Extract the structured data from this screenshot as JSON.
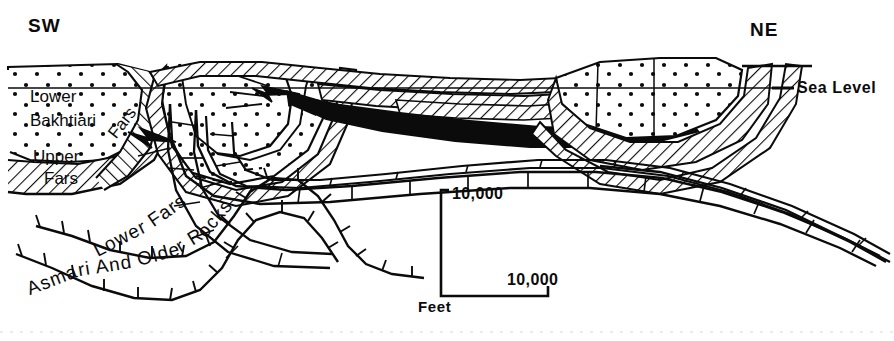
{
  "figure": {
    "type": "geologic-cross-section",
    "orientation_left": "SW",
    "orientation_right": "NE",
    "datum_label": "Sea Level",
    "background_color": "#ffffff",
    "ink_color": "#0b0b0b"
  },
  "annotations": {
    "sw": "SW",
    "ne": "NE",
    "sea_level": "Sea Level"
  },
  "units": {
    "lower": "Lower",
    "bakhtiari": "Bakhtiari",
    "upper": "Upper",
    "fars_upper": "Fars",
    "fars_lower": "Fars",
    "lower_fars_curved": "Lower Fars",
    "asmari_curved": "Asmari And Older Rocks"
  },
  "curved_labels": {
    "lower_fars": [
      "L",
      "o",
      "w",
      "e",
      "r",
      " ",
      "F",
      "a",
      "r",
      "s"
    ],
    "asmari": [
      "A",
      "s",
      "m",
      "a",
      "r",
      "i",
      " ",
      "A",
      "n",
      "d",
      " ",
      "O",
      "l",
      "d",
      "e",
      "r",
      " ",
      "R",
      "o",
      "c",
      "k",
      "s"
    ]
  },
  "scale_bar": {
    "vertical_value": "10,000",
    "horizontal_value": "10,000",
    "units_label": "Feet"
  },
  "legend_patterns": {
    "stipple": "Lower Bakhtiari conglomerate (dotted / stippled)",
    "hatch": "Upper Fars and Lower Fars (diagonal ruled hatching)",
    "brick": "Asmari and older rocks (limestone brick pattern)",
    "solid_black": "Thrust / detachment wedge (solid black)"
  }
}
